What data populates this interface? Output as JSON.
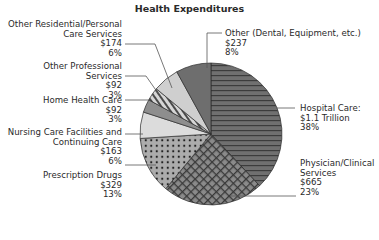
{
  "chart_data": {
    "type": "pie",
    "title": "Health Expenditures",
    "xlabel": "",
    "ylabel": "",
    "start_angle": "12 o'clock, clockwise",
    "slices": [
      {
        "name": "Hospital Care",
        "label": "Hospital Care:",
        "amount": "$1.1 Trillion",
        "percent": 38,
        "pattern": "horizontal-lines",
        "color": "#6a6a6a"
      },
      {
        "name": "Physician/Clinical Services",
        "label": "Physician/Clinical Services",
        "amount": "$665",
        "percent": 23,
        "pattern": "crosshatch",
        "color": "#7a7a7a"
      },
      {
        "name": "Prescription Drugs",
        "label": "Prescription Drugs",
        "amount": "$329",
        "percent": 13,
        "pattern": "dots",
        "color": "#a8a8a8"
      },
      {
        "name": "Nursing Care Facilities and Continuing Care",
        "label": "Nursing Care Facilities and Continuing Care",
        "amount": "$163",
        "percent": 6,
        "pattern": "solid",
        "color": "#dcdcdc"
      },
      {
        "name": "Home Health Care",
        "label": "Home Health Care",
        "amount": "$92",
        "percent": 3,
        "pattern": "solid",
        "color": "#8e8e8e"
      },
      {
        "name": "Other Professional Services",
        "label": "Other Professional Services",
        "amount": "$92",
        "percent": 3,
        "pattern": "diagonal-stripes",
        "color": "#b4b4b4"
      },
      {
        "name": "Other Residential/Personal Care Services",
        "label": "Other Residential/Personal Care Services",
        "amount": "$174",
        "percent": 6,
        "pattern": "solid",
        "color": "#cfcfcf"
      },
      {
        "name": "Other (Dental, Equipment, etc.)",
        "label": "Other (Dental, Equipment, etc.)",
        "amount": "$237",
        "percent": 8,
        "pattern": "solid",
        "color": "#6e6e6e"
      }
    ],
    "values": [
      38,
      23,
      13,
      6,
      3,
      3,
      6,
      8
    ],
    "categories": [
      "Hospital Care",
      "Physician/Clinical Services",
      "Prescription Drugs",
      "Nursing Care Facilities and Continuing Care",
      "Home Health Care",
      "Other Professional Services",
      "Other Residential/Personal Care Services",
      "Other (Dental, Equipment, etc.)"
    ],
    "amounts": [
      "$1.1 Trillion",
      "$665",
      "$329",
      "$163",
      "$92",
      "$92",
      "$174",
      "$237"
    ]
  },
  "title": "Health Expenditures",
  "labels": {
    "other_residential": {
      "line1": "Other Residential/Personal",
      "line2": "Care Services",
      "amount": "$174",
      "percent": "6%"
    },
    "other_professional": {
      "line1": "Other Professional",
      "line2": "Services",
      "amount": "$92",
      "percent": "3%"
    },
    "home_health": {
      "line1": "Home Health Care",
      "amount": "$92",
      "percent": "3%"
    },
    "nursing": {
      "line1": "Nursing Care Facilities and",
      "line2": "Continuing Care",
      "amount": "$163",
      "percent": "6%"
    },
    "prescription": {
      "line1": "Prescription Drugs",
      "amount": "$329",
      "percent": "13%"
    },
    "other": {
      "line1": "Other (Dental, Equipment, etc.)",
      "amount": "$237",
      "percent": "8%"
    },
    "hospital": {
      "line1": "Hospital Care:",
      "amount": "$1.1 Trillion",
      "percent": "38%"
    },
    "physician": {
      "line1": "Physician/Clinical",
      "line2": "Services",
      "amount": "$665",
      "percent": "23%"
    }
  }
}
